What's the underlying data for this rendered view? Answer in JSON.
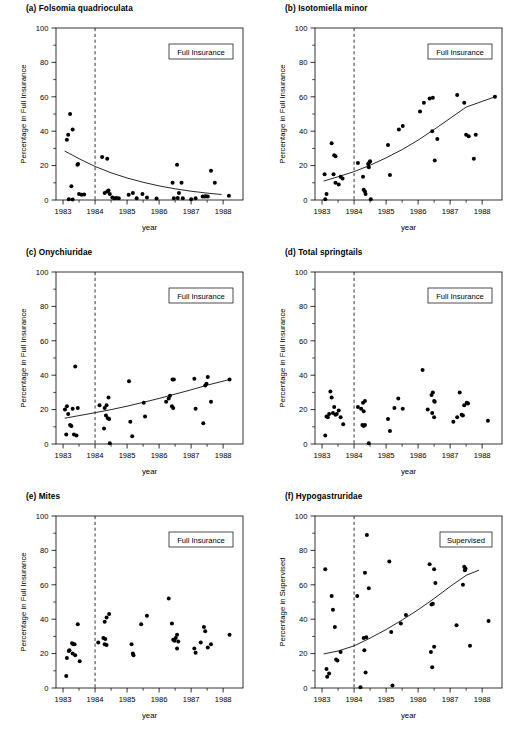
{
  "figure": {
    "width": 518,
    "height": 733,
    "background": "#ffffff",
    "ink": "#000000"
  },
  "axes_common": {
    "xlabel": "year",
    "xlim": [
      1982.78,
      1988.62
    ],
    "ylim": [
      0,
      100
    ],
    "yticks": [
      0,
      20,
      40,
      60,
      80,
      100
    ],
    "yticklabels": [
      "0",
      "20",
      "40",
      "60",
      "80",
      "100"
    ],
    "xticks": [
      1983,
      1984,
      1985,
      1986,
      1987,
      1988
    ],
    "xticklabels": [
      "1983",
      "1984",
      "1985",
      "1986",
      "1987",
      "1988"
    ],
    "minor_y": [
      10,
      30,
      50,
      70,
      90
    ],
    "minor_x": [
      1983.5,
      1984.5,
      1985.5,
      1986.5,
      1987.5
    ],
    "reference_line_x": 1984.0,
    "reference_line_style": "dashed",
    "grid": false,
    "marker": "filled-circle"
  },
  "chart_data": [
    {
      "type": "scatter",
      "panel": "a",
      "title": "(a) Folsomia quadrioculata",
      "legend": "Full Insurance",
      "xlabel": "year",
      "ylabel": "Percentage in Full Insurance",
      "xlim": [
        1982.78,
        1988.62
      ],
      "ylim": [
        0,
        100
      ],
      "points": [
        [
          1983.12,
          35.0
        ],
        [
          1983.16,
          38.0
        ],
        [
          1983.22,
          50.0
        ],
        [
          1983.3,
          41.0
        ],
        [
          1983.45,
          20.5
        ],
        [
          1983.47,
          21.0
        ],
        [
          1983.18,
          0.5
        ],
        [
          1983.3,
          0.3
        ],
        [
          1983.26,
          8.0
        ],
        [
          1983.5,
          3.5
        ],
        [
          1983.58,
          3.0
        ],
        [
          1983.66,
          3.2
        ],
        [
          1984.22,
          25.0
        ],
        [
          1984.38,
          24.0
        ],
        [
          1984.3,
          4.0
        ],
        [
          1984.38,
          5.0
        ],
        [
          1984.42,
          5.5
        ],
        [
          1984.46,
          3.5
        ],
        [
          1984.54,
          1.5
        ],
        [
          1984.6,
          1.0
        ],
        [
          1984.66,
          1.2
        ],
        [
          1984.74,
          1.0
        ],
        [
          1985.05,
          3.0
        ],
        [
          1985.18,
          4.0
        ],
        [
          1985.3,
          1.0
        ],
        [
          1985.48,
          3.5
        ],
        [
          1985.62,
          1.5
        ],
        [
          1985.92,
          0.8
        ],
        [
          1986.42,
          10.0
        ],
        [
          1986.56,
          20.5
        ],
        [
          1986.7,
          10.0
        ],
        [
          1986.46,
          1.0
        ],
        [
          1986.58,
          1.2
        ],
        [
          1986.62,
          4.0
        ],
        [
          1986.74,
          1.0
        ],
        [
          1987.0,
          0.5
        ],
        [
          1987.14,
          1.0
        ],
        [
          1987.36,
          2.0
        ],
        [
          1987.42,
          2.0
        ],
        [
          1987.46,
          2.2
        ],
        [
          1987.52,
          2.0
        ],
        [
          1987.62,
          17.0
        ],
        [
          1987.74,
          10.0
        ],
        [
          1988.18,
          2.5
        ]
      ],
      "trend": {
        "kind": "decreasing-exponential",
        "points": [
          [
            1983.05,
            28.5
          ],
          [
            1983.5,
            24.0
          ],
          [
            1984.0,
            19.5
          ],
          [
            1984.5,
            15.8
          ],
          [
            1985.0,
            12.8
          ],
          [
            1985.5,
            10.3
          ],
          [
            1986.0,
            8.2
          ],
          [
            1986.5,
            6.5
          ],
          [
            1987.0,
            5.1
          ],
          [
            1987.5,
            4.0
          ],
          [
            1987.95,
            3.2
          ]
        ]
      }
    },
    {
      "type": "scatter",
      "panel": "b",
      "title": "(b) Isotomiella minor",
      "legend": "Full Insurance",
      "xlabel": "year",
      "ylabel": "Percentage in Full Insurance",
      "xlim": [
        1982.78,
        1988.62
      ],
      "ylim": [
        0,
        100
      ],
      "points": [
        [
          1983.08,
          15.0
        ],
        [
          1983.1,
          0.5
        ],
        [
          1983.14,
          3.5
        ],
        [
          1983.3,
          33.0
        ],
        [
          1983.38,
          26.0
        ],
        [
          1983.42,
          25.5
        ],
        [
          1983.36,
          15.0
        ],
        [
          1983.42,
          10.0
        ],
        [
          1983.52,
          9.0
        ],
        [
          1983.58,
          13.5
        ],
        [
          1983.64,
          12.5
        ],
        [
          1984.12,
          21.5
        ],
        [
          1984.28,
          13.5
        ],
        [
          1984.3,
          6.0
        ],
        [
          1984.34,
          5.0
        ],
        [
          1984.36,
          3.5
        ],
        [
          1984.44,
          21.0
        ],
        [
          1984.48,
          22.0
        ],
        [
          1984.5,
          22.5
        ],
        [
          1984.46,
          19.0
        ],
        [
          1984.52,
          0.5
        ],
        [
          1985.06,
          32.0
        ],
        [
          1985.12,
          14.5
        ],
        [
          1985.4,
          41.0
        ],
        [
          1985.52,
          43.0
        ],
        [
          1986.06,
          51.5
        ],
        [
          1986.18,
          56.5
        ],
        [
          1986.36,
          59.0
        ],
        [
          1986.46,
          59.5
        ],
        [
          1986.44,
          40.0
        ],
        [
          1986.6,
          35.5
        ],
        [
          1986.52,
          23.0
        ],
        [
          1987.22,
          61.0
        ],
        [
          1987.44,
          56.5
        ],
        [
          1987.5,
          38.0
        ],
        [
          1987.58,
          37.0
        ],
        [
          1987.8,
          38.0
        ],
        [
          1987.74,
          24.0
        ],
        [
          1988.4,
          60.0
        ]
      ],
      "trend": {
        "kind": "increasing-exponential",
        "points": [
          [
            1983.05,
            11.0
          ],
          [
            1983.5,
            13.5
          ],
          [
            1984.0,
            16.5
          ],
          [
            1984.5,
            20.2
          ],
          [
            1985.0,
            24.5
          ],
          [
            1985.5,
            29.3
          ],
          [
            1986.0,
            34.8
          ],
          [
            1986.5,
            41.0
          ],
          [
            1987.0,
            47.5
          ],
          [
            1987.5,
            54.0
          ],
          [
            1988.4,
            60.0
          ]
        ]
      }
    },
    {
      "type": "scatter",
      "panel": "c",
      "title": "(c) Onychiuridae",
      "legend": "Full Insurance",
      "xlabel": "year",
      "ylabel": "Percentage in Full Insurance",
      "xlim": [
        1982.78,
        1988.62
      ],
      "ylim": [
        0,
        100
      ],
      "points": [
        [
          1983.06,
          20.0
        ],
        [
          1983.12,
          22.0
        ],
        [
          1983.16,
          17.5
        ],
        [
          1983.1,
          5.5
        ],
        [
          1983.22,
          11.0
        ],
        [
          1983.26,
          10.5
        ],
        [
          1983.3,
          20.5
        ],
        [
          1983.38,
          45.0
        ],
        [
          1983.46,
          21.0
        ],
        [
          1983.34,
          5.5
        ],
        [
          1983.42,
          5.0
        ],
        [
          1984.14,
          22.5
        ],
        [
          1984.3,
          21.0
        ],
        [
          1984.36,
          22.5
        ],
        [
          1984.42,
          27.0
        ],
        [
          1984.34,
          16.5
        ],
        [
          1984.4,
          15.0
        ],
        [
          1984.44,
          14.5
        ],
        [
          1984.28,
          9.0
        ],
        [
          1984.46,
          0.5
        ],
        [
          1985.06,
          36.5
        ],
        [
          1985.1,
          13.0
        ],
        [
          1985.16,
          4.5
        ],
        [
          1985.52,
          24.0
        ],
        [
          1985.56,
          16.0
        ],
        [
          1986.22,
          24.5
        ],
        [
          1986.3,
          26.5
        ],
        [
          1986.34,
          28.0
        ],
        [
          1986.42,
          37.5
        ],
        [
          1986.46,
          37.5
        ],
        [
          1986.4,
          22.0
        ],
        [
          1986.44,
          21.0
        ],
        [
          1987.1,
          38.0
        ],
        [
          1987.14,
          20.5
        ],
        [
          1987.44,
          34.0
        ],
        [
          1987.48,
          35.0
        ],
        [
          1987.52,
          39.0
        ],
        [
          1987.38,
          12.0
        ],
        [
          1987.62,
          24.5
        ],
        [
          1988.2,
          37.5
        ]
      ],
      "trend": {
        "kind": "increasing-exponential",
        "points": [
          [
            1983.05,
            15.0
          ],
          [
            1983.5,
            16.5
          ],
          [
            1984.0,
            18.2
          ],
          [
            1984.5,
            20.0
          ],
          [
            1985.0,
            22.0
          ],
          [
            1985.5,
            24.2
          ],
          [
            1986.0,
            26.5
          ],
          [
            1986.5,
            29.0
          ],
          [
            1987.0,
            31.5
          ],
          [
            1987.5,
            34.2
          ],
          [
            1988.2,
            37.5
          ]
        ]
      }
    },
    {
      "type": "scatter",
      "panel": "d",
      "title": "(d) Total springtails",
      "legend": "Full Insurance",
      "xlabel": "year",
      "ylabel": "Percentage in Full Insurance",
      "xlim": [
        1982.78,
        1988.62
      ],
      "ylim": [
        0,
        100
      ],
      "trend": null,
      "points": [
        [
          1983.1,
          5.0
        ],
        [
          1983.14,
          16.0
        ],
        [
          1983.18,
          15.5
        ],
        [
          1983.22,
          17.5
        ],
        [
          1983.26,
          30.5
        ],
        [
          1983.3,
          27.0
        ],
        [
          1983.34,
          18.0
        ],
        [
          1983.38,
          21.5
        ],
        [
          1983.42,
          17.0
        ],
        [
          1983.46,
          17.5
        ],
        [
          1983.52,
          19.5
        ],
        [
          1983.58,
          15.5
        ],
        [
          1983.66,
          11.5
        ],
        [
          1984.12,
          21.5
        ],
        [
          1984.22,
          20.5
        ],
        [
          1984.28,
          24.0
        ],
        [
          1984.34,
          25.0
        ],
        [
          1984.3,
          19.0
        ],
        [
          1984.26,
          11.0
        ],
        [
          1984.3,
          10.5
        ],
        [
          1984.34,
          11.0
        ],
        [
          1984.46,
          0.5
        ],
        [
          1985.06,
          14.5
        ],
        [
          1985.12,
          7.5
        ],
        [
          1985.26,
          21.0
        ],
        [
          1985.38,
          26.5
        ],
        [
          1985.52,
          20.5
        ],
        [
          1986.14,
          43.0
        ],
        [
          1986.3,
          20.0
        ],
        [
          1986.42,
          28.5
        ],
        [
          1986.46,
          30.0
        ],
        [
          1986.5,
          25.0
        ],
        [
          1986.52,
          24.5
        ],
        [
          1986.44,
          18.0
        ],
        [
          1986.5,
          15.5
        ],
        [
          1987.1,
          13.0
        ],
        [
          1987.22,
          15.5
        ],
        [
          1987.3,
          30.0
        ],
        [
          1987.36,
          17.0
        ],
        [
          1987.44,
          22.5
        ],
        [
          1987.52,
          24.0
        ],
        [
          1987.56,
          23.5
        ],
        [
          1987.4,
          16.5
        ],
        [
          1988.18,
          13.5
        ]
      ]
    },
    {
      "type": "scatter",
      "panel": "e",
      "title": "(e) Mites",
      "legend": "Full Insurance",
      "xlabel": "year",
      "ylabel": "Percentage in Full Insurance",
      "xlim": [
        1982.78,
        1988.62
      ],
      "ylim": [
        0,
        100
      ],
      "trend": null,
      "points": [
        [
          1983.1,
          7.0
        ],
        [
          1983.12,
          17.5
        ],
        [
          1983.18,
          21.5
        ],
        [
          1983.2,
          22.0
        ],
        [
          1983.28,
          26.0
        ],
        [
          1983.32,
          25.5
        ],
        [
          1983.36,
          25.5
        ],
        [
          1983.3,
          20.0
        ],
        [
          1983.38,
          19.0
        ],
        [
          1983.46,
          37.0
        ],
        [
          1983.52,
          15.5
        ],
        [
          1984.1,
          26.5
        ],
        [
          1984.3,
          38.5
        ],
        [
          1984.36,
          41.0
        ],
        [
          1984.44,
          43.0
        ],
        [
          1984.26,
          29.0
        ],
        [
          1984.32,
          28.5
        ],
        [
          1984.3,
          25.5
        ],
        [
          1984.36,
          25.0
        ],
        [
          1985.14,
          25.5
        ],
        [
          1985.18,
          20.0
        ],
        [
          1985.2,
          19.0
        ],
        [
          1985.44,
          37.0
        ],
        [
          1985.62,
          42.0
        ],
        [
          1986.3,
          52.0
        ],
        [
          1986.4,
          37.5
        ],
        [
          1986.44,
          28.0
        ],
        [
          1986.48,
          27.5
        ],
        [
          1986.52,
          29.0
        ],
        [
          1986.56,
          31.0
        ],
        [
          1986.6,
          27.0
        ],
        [
          1986.56,
          23.0
        ],
        [
          1987.1,
          23.0
        ],
        [
          1987.14,
          20.5
        ],
        [
          1987.3,
          26.5
        ],
        [
          1987.4,
          35.5
        ],
        [
          1987.44,
          33.0
        ],
        [
          1987.52,
          23.5
        ],
        [
          1987.62,
          25.5
        ],
        [
          1988.2,
          31.0
        ]
      ]
    },
    {
      "type": "scatter",
      "panel": "f",
      "title": "(f) Hypogastruridae",
      "legend": "Supervised",
      "xlabel": "year",
      "ylabel": "Percentage in Supervised",
      "xlim": [
        1982.78,
        1988.62
      ],
      "ylim": [
        0,
        100
      ],
      "points": [
        [
          1983.1,
          69.0
        ],
        [
          1983.14,
          11.0
        ],
        [
          1983.16,
          6.5
        ],
        [
          1983.22,
          8.5
        ],
        [
          1983.3,
          53.5
        ],
        [
          1983.34,
          45.5
        ],
        [
          1983.4,
          35.5
        ],
        [
          1983.44,
          16.5
        ],
        [
          1983.48,
          16.0
        ],
        [
          1983.58,
          21.0
        ],
        [
          1984.1,
          53.5
        ],
        [
          1984.2,
          0.5
        ],
        [
          1984.34,
          67.0
        ],
        [
          1984.4,
          89.0
        ],
        [
          1984.46,
          58.0
        ],
        [
          1984.3,
          29.0
        ],
        [
          1984.38,
          29.5
        ],
        [
          1984.32,
          22.0
        ],
        [
          1984.36,
          9.0
        ],
        [
          1985.1,
          73.5
        ],
        [
          1985.16,
          32.5
        ],
        [
          1985.2,
          1.5
        ],
        [
          1985.46,
          37.5
        ],
        [
          1985.62,
          42.5
        ],
        [
          1986.36,
          72.0
        ],
        [
          1986.42,
          48.5
        ],
        [
          1986.46,
          49.0
        ],
        [
          1986.5,
          69.0
        ],
        [
          1986.54,
          61.0
        ],
        [
          1986.4,
          21.0
        ],
        [
          1986.44,
          12.0
        ],
        [
          1986.5,
          24.0
        ],
        [
          1987.44,
          70.5
        ],
        [
          1987.46,
          68.5
        ],
        [
          1987.48,
          69.5
        ],
        [
          1987.4,
          60.0
        ],
        [
          1987.2,
          36.5
        ],
        [
          1987.62,
          24.5
        ],
        [
          1988.2,
          39.0
        ]
      ],
      "trend": {
        "kind": "increasing-exponential",
        "points": [
          [
            1983.05,
            19.8
          ],
          [
            1983.5,
            21.5
          ],
          [
            1984.0,
            24.5
          ],
          [
            1984.5,
            29.0
          ],
          [
            1985.0,
            34.0
          ],
          [
            1985.5,
            39.5
          ],
          [
            1986.0,
            45.5
          ],
          [
            1986.5,
            52.0
          ],
          [
            1987.0,
            59.0
          ],
          [
            1987.5,
            65.5
          ],
          [
            1987.9,
            68.5
          ]
        ]
      }
    }
  ]
}
